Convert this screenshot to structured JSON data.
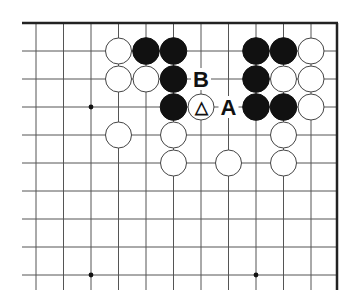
{
  "diagram": {
    "type": "go-board-fragment",
    "grid": {
      "x_lines": [
        36,
        63.5,
        91,
        118.5,
        146,
        173.5,
        201,
        228.5,
        256,
        283.5,
        311
      ],
      "y_lines": [
        51,
        79,
        107,
        135,
        163,
        191,
        219,
        247,
        275
      ],
      "top_edge_y": 23,
      "right_edge_x": 337,
      "left_open_x": 22,
      "bottom_open_y": 290,
      "line_color": "#555555",
      "edge_color": "#222222"
    },
    "star_points": [
      {
        "col": 2,
        "row": 2
      },
      {
        "col": 2,
        "row": 8
      },
      {
        "col": 8,
        "row": 8
      }
    ],
    "stones": [
      {
        "color": "white",
        "col": 3,
        "row": 0
      },
      {
        "color": "black",
        "col": 4,
        "row": 0
      },
      {
        "color": "black",
        "col": 5,
        "row": 0
      },
      {
        "color": "black",
        "col": 8,
        "row": 0
      },
      {
        "color": "black",
        "col": 9,
        "row": 0
      },
      {
        "color": "white",
        "col": 10,
        "row": 0
      },
      {
        "color": "white",
        "col": 3,
        "row": 1
      },
      {
        "color": "white",
        "col": 4,
        "row": 1
      },
      {
        "color": "black",
        "col": 5,
        "row": 1
      },
      {
        "color": "black",
        "col": 8,
        "row": 1
      },
      {
        "color": "white",
        "col": 9,
        "row": 1
      },
      {
        "color": "white",
        "col": 10,
        "row": 1
      },
      {
        "color": "black",
        "col": 5,
        "row": 2
      },
      {
        "color": "white",
        "col": 6,
        "row": 2,
        "mark": "△"
      },
      {
        "color": "black",
        "col": 8,
        "row": 2
      },
      {
        "color": "black",
        "col": 9,
        "row": 2
      },
      {
        "color": "white",
        "col": 10,
        "row": 2
      },
      {
        "color": "white",
        "col": 3,
        "row": 3
      },
      {
        "color": "white",
        "col": 5,
        "row": 3
      },
      {
        "color": "white",
        "col": 9,
        "row": 3
      },
      {
        "color": "white",
        "col": 5,
        "row": 4
      },
      {
        "color": "white",
        "col": 7,
        "row": 4
      },
      {
        "color": "white",
        "col": 9,
        "row": 4
      }
    ],
    "labels": [
      {
        "text": "B",
        "col": 6,
        "row": 1
      },
      {
        "text": "A",
        "col": 7,
        "row": 2
      }
    ]
  }
}
